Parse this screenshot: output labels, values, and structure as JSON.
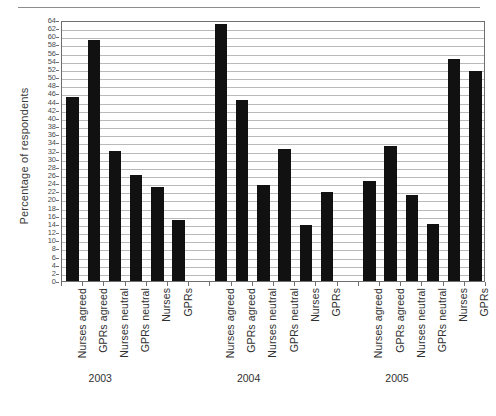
{
  "figure": {
    "ylabel": "Percentage of respondents",
    "axis_color": "#6f6f6f",
    "grid_color": "#b9b9b9",
    "bar_color": "#111111",
    "background": "#ffffff"
  },
  "chart_data": {
    "type": "bar",
    "title": "",
    "xlabel": "",
    "ylabel": "Percentage of respondents",
    "ylim": [
      0,
      64
    ],
    "ytick_step": 2,
    "yticks": [
      0,
      2,
      4,
      6,
      8,
      10,
      12,
      14,
      16,
      18,
      20,
      22,
      24,
      26,
      28,
      30,
      32,
      34,
      36,
      38,
      40,
      42,
      44,
      46,
      48,
      50,
      52,
      54,
      56,
      58,
      60,
      62,
      64
    ],
    "grid": true,
    "legend": "none",
    "groups": [
      "2003",
      "2004",
      "2005"
    ],
    "categories": [
      "Nurses agreed",
      "GPRs agreed",
      "Nurses neutral",
      "GPRs neutral",
      "Nurses",
      "GPRs"
    ],
    "bars": [
      {
        "group": "2003",
        "category": "Nurses agreed",
        "value": 45
      },
      {
        "group": "2003",
        "category": "GPRs agreed",
        "value": 59
      },
      {
        "group": "2003",
        "category": "Nurses neutral",
        "value": 32
      },
      {
        "group": "2003",
        "category": "GPRs neutral",
        "value": 26
      },
      {
        "group": "2003",
        "category": "Nurses",
        "value": 23
      },
      {
        "group": "2003",
        "category": "GPRs",
        "value": 15
      },
      {
        "group": "2004",
        "category": "Nurses agreed",
        "value": 63
      },
      {
        "group": "2004",
        "category": "GPRs agreed",
        "value": 44.5
      },
      {
        "group": "2004",
        "category": "Nurses neutral",
        "value": 23.5
      },
      {
        "group": "2004",
        "category": "GPRs neutral",
        "value": 32.3
      },
      {
        "group": "2004",
        "category": "Nurses",
        "value": 13.7
      },
      {
        "group": "2004",
        "category": "GPRs",
        "value": 21.8
      },
      {
        "group": "2005",
        "category": "Nurses agreed",
        "value": 24.6
      },
      {
        "group": "2005",
        "category": "GPRs agreed",
        "value": 33
      },
      {
        "group": "2005",
        "category": "Nurses neutral",
        "value": 21
      },
      {
        "group": "2005",
        "category": "GPRs neutral",
        "value": 14
      },
      {
        "group": "2005",
        "category": "Nurses",
        "value": 54.5
      },
      {
        "group": "2005",
        "category": "GPRs",
        "value": 51.5
      }
    ],
    "series": [
      {
        "name": "2003",
        "values": [
          45,
          59,
          32,
          26,
          23,
          15
        ]
      },
      {
        "name": "2004",
        "values": [
          63,
          44.5,
          23.5,
          32.3,
          13.7,
          21.8
        ]
      },
      {
        "name": "2005",
        "values": [
          24.6,
          33,
          21,
          14,
          54.5,
          51.5
        ]
      }
    ]
  }
}
